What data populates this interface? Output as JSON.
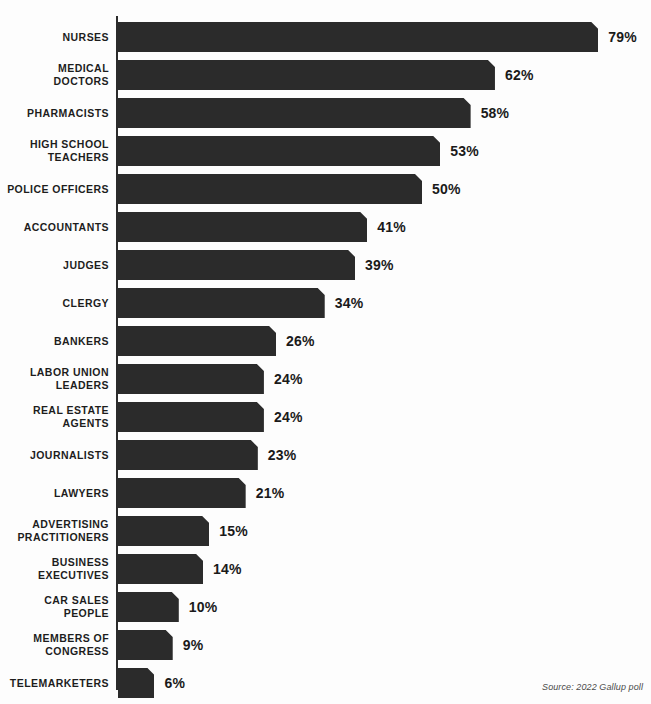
{
  "kicker": "Honest and ethical",
  "source_note": "Source: 2022 Gallup poll",
  "colors": {
    "bar": "#2b2b2b",
    "axis": "#2b2b2b",
    "label_text": "#1d1d1d",
    "value_text": "#1a1a1a",
    "background": "#fdfdfd",
    "source_text": "#4a4a4a"
  },
  "chart_data": {
    "type": "bar",
    "orientation": "horizontal",
    "title": "Honest and ethical",
    "subtitle": "",
    "xlabel": "",
    "ylabel": "",
    "xlim": [
      0,
      79
    ],
    "grid": false,
    "legend": null,
    "value_suffix": "%",
    "annotation": "Source: 2022 Gallup poll",
    "categories": [
      "NURSES",
      "MEDICAL DOCTORS",
      "PHARMACISTS",
      "HIGH SCHOOL TEACHERS",
      "POLICE OFFICERS",
      "ACCOUNTANTS",
      "JUDGES",
      "CLERGY",
      "BANKERS",
      "LABOR UNION LEADERS",
      "REAL ESTATE AGENTS",
      "JOURNALISTS",
      "LAWYERS",
      "ADVERTISING PRACTITIONERS",
      "BUSINESS EXECUTIVES",
      "CAR SALES PEOPLE",
      "MEMBERS OF CONGRESS",
      "TELEMARKETERS"
    ],
    "values": [
      79,
      62,
      58,
      53,
      50,
      41,
      39,
      34,
      26,
      24,
      24,
      23,
      21,
      15,
      14,
      10,
      9,
      6
    ]
  },
  "bars": [
    {
      "label": "NURSES",
      "value": 79,
      "value_text": "79%"
    },
    {
      "label": "MEDICAL\nDOCTORS",
      "value": 62,
      "value_text": "62%"
    },
    {
      "label": "PHARMACISTS",
      "value": 58,
      "value_text": "58%"
    },
    {
      "label": "HIGH SCHOOL\nTEACHERS",
      "value": 53,
      "value_text": "53%"
    },
    {
      "label": "POLICE OFFICERS",
      "value": 50,
      "value_text": "50%"
    },
    {
      "label": "ACCOUNTANTS",
      "value": 41,
      "value_text": "41%"
    },
    {
      "label": "JUDGES",
      "value": 39,
      "value_text": "39%"
    },
    {
      "label": "CLERGY",
      "value": 34,
      "value_text": "34%"
    },
    {
      "label": "BANKERS",
      "value": 26,
      "value_text": "26%"
    },
    {
      "label": "LABOR UNION\nLEADERS",
      "value": 24,
      "value_text": "24%"
    },
    {
      "label": "REAL ESTATE\nAGENTS",
      "value": 24,
      "value_text": "24%"
    },
    {
      "label": "JOURNALISTS",
      "value": 23,
      "value_text": "23%"
    },
    {
      "label": "LAWYERS",
      "value": 21,
      "value_text": "21%"
    },
    {
      "label": "ADVERTISING\nPRACTITIONERS",
      "value": 15,
      "value_text": "15%"
    },
    {
      "label": "BUSINESS\nEXECUTIVES",
      "value": 14,
      "value_text": "14%"
    },
    {
      "label": "CAR SALES\nPEOPLE",
      "value": 10,
      "value_text": "10%"
    },
    {
      "label": "MEMBERS OF\nCONGRESS",
      "value": 9,
      "value_text": "9%"
    },
    {
      "label": "TELEMARKETERS",
      "value": 6,
      "value_text": "6%"
    }
  ],
  "layout": {
    "bar_origin_x": 118,
    "bar_height": 30,
    "row_pitch": 38,
    "first_row_top": 6,
    "px_per_unit": 6.08,
    "value_gap": 10
  }
}
